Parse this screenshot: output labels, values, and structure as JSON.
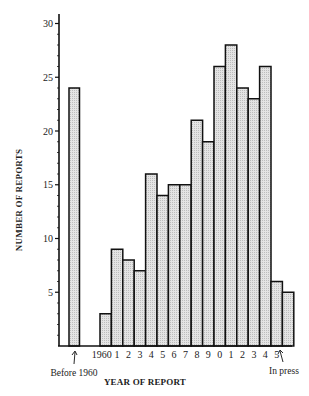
{
  "chart_data": {
    "type": "bar",
    "title": "",
    "xlabel": "YEAR OF REPORT",
    "ylabel": "NUMBER OF REPORTS",
    "ylim": [
      0,
      30
    ],
    "yticks": [
      5,
      10,
      15,
      20,
      25,
      30
    ],
    "grid": false,
    "legend": null,
    "categories": [
      "Before 1960",
      "1960",
      "1961",
      "1962",
      "1963",
      "1964",
      "1965",
      "1966",
      "1967",
      "1968",
      "1969",
      "1970",
      "1971",
      "1972",
      "1973",
      "1974",
      "1975",
      "In press"
    ],
    "tick_labels": [
      "",
      "1960",
      "1",
      "2",
      "3",
      "4",
      "5",
      "6",
      "7",
      "8",
      "9",
      "0",
      "1",
      "2",
      "3",
      "4",
      "5",
      ""
    ],
    "values": [
      24,
      3,
      9,
      8,
      7,
      16,
      14,
      15,
      15,
      21,
      19,
      26,
      28,
      24,
      23,
      26,
      6,
      5
    ],
    "annotations": [
      {
        "text": "Before 1960",
        "points_to": "Before 1960"
      },
      {
        "text": "In press",
        "points_to": "In press"
      }
    ],
    "bar_fill": "#d9d9d9",
    "bar_stroke": "#111111"
  }
}
